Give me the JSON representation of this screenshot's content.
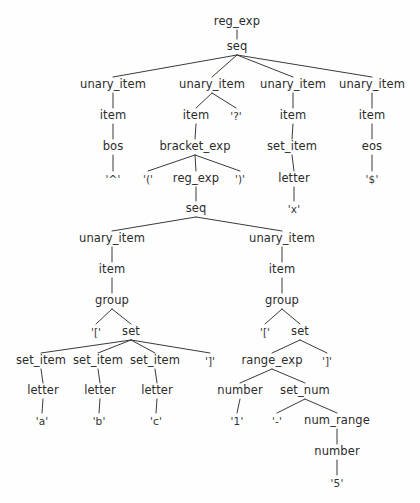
{
  "figure": {
    "kind": "parse-tree",
    "background_color": "#fefefe",
    "text_color": "#2b2b2b",
    "edge_color": "#3a3a3a"
  },
  "nodes": [
    {
      "id": "n0",
      "label": "reg_exp",
      "x": 237,
      "y": 22,
      "kind": "nonterminal"
    },
    {
      "id": "n1",
      "label": "seq",
      "x": 237,
      "y": 47,
      "kind": "nonterminal"
    },
    {
      "id": "n2",
      "label": "unary_item",
      "x": 113,
      "y": 85,
      "kind": "nonterminal"
    },
    {
      "id": "n3",
      "label": "unary_item",
      "x": 212,
      "y": 85,
      "kind": "nonterminal"
    },
    {
      "id": "n4",
      "label": "unary_item",
      "x": 293,
      "y": 85,
      "kind": "nonterminal"
    },
    {
      "id": "n5",
      "label": "unary_item",
      "x": 372,
      "y": 85,
      "kind": "nonterminal"
    },
    {
      "id": "n6",
      "label": "item",
      "x": 113,
      "y": 116,
      "kind": "nonterminal"
    },
    {
      "id": "n7",
      "label": "item",
      "x": 196,
      "y": 116,
      "kind": "nonterminal"
    },
    {
      "id": "n8",
      "label": "'?'",
      "x": 236,
      "y": 116,
      "kind": "terminal"
    },
    {
      "id": "n9",
      "label": "item",
      "x": 293,
      "y": 116,
      "kind": "nonterminal"
    },
    {
      "id": "n10",
      "label": "item",
      "x": 372,
      "y": 116,
      "kind": "nonterminal"
    },
    {
      "id": "n11",
      "label": "bos",
      "x": 113,
      "y": 147,
      "kind": "nonterminal"
    },
    {
      "id": "n12",
      "label": "bracket_exp",
      "x": 195,
      "y": 147,
      "kind": "nonterminal"
    },
    {
      "id": "n13",
      "label": "set_item",
      "x": 292,
      "y": 147,
      "kind": "nonterminal"
    },
    {
      "id": "n14",
      "label": "eos",
      "x": 372,
      "y": 147,
      "kind": "nonterminal"
    },
    {
      "id": "n15",
      "label": "'^'",
      "x": 113,
      "y": 179,
      "kind": "terminal"
    },
    {
      "id": "n16",
      "label": "'('",
      "x": 148,
      "y": 179,
      "kind": "terminal"
    },
    {
      "id": "n17",
      "label": "reg_exp",
      "x": 196,
      "y": 179,
      "kind": "nonterminal"
    },
    {
      "id": "n18",
      "label": "')'",
      "x": 240,
      "y": 179,
      "kind": "terminal"
    },
    {
      "id": "n19",
      "label": "letter",
      "x": 294,
      "y": 179,
      "kind": "nonterminal"
    },
    {
      "id": "n20",
      "label": "'$'",
      "x": 372,
      "y": 179,
      "kind": "terminal"
    },
    {
      "id": "n21",
      "label": "seq",
      "x": 196,
      "y": 209,
      "kind": "nonterminal"
    },
    {
      "id": "n22",
      "label": "'x'",
      "x": 294,
      "y": 209,
      "kind": "terminal"
    },
    {
      "id": "n23",
      "label": "unary_item",
      "x": 112,
      "y": 239,
      "kind": "nonterminal"
    },
    {
      "id": "n24",
      "label": "unary_item",
      "x": 282,
      "y": 239,
      "kind": "nonterminal"
    },
    {
      "id": "n25",
      "label": "item",
      "x": 112,
      "y": 270,
      "kind": "nonterminal"
    },
    {
      "id": "n26",
      "label": "item",
      "x": 282,
      "y": 270,
      "kind": "nonterminal"
    },
    {
      "id": "n27",
      "label": "group",
      "x": 112,
      "y": 301,
      "kind": "nonterminal"
    },
    {
      "id": "n28",
      "label": "group",
      "x": 282,
      "y": 301,
      "kind": "nonterminal"
    },
    {
      "id": "n29",
      "label": "'['",
      "x": 96,
      "y": 332,
      "kind": "terminal"
    },
    {
      "id": "n30",
      "label": "set",
      "x": 131,
      "y": 332,
      "kind": "nonterminal"
    },
    {
      "id": "n31",
      "label": "'['",
      "x": 265,
      "y": 332,
      "kind": "terminal"
    },
    {
      "id": "n32",
      "label": "set",
      "x": 300,
      "y": 332,
      "kind": "nonterminal"
    },
    {
      "id": "n33",
      "label": "set_item",
      "x": 41,
      "y": 361,
      "kind": "nonterminal"
    },
    {
      "id": "n34",
      "label": "set_item",
      "x": 98,
      "y": 361,
      "kind": "nonterminal"
    },
    {
      "id": "n35",
      "label": "set_item",
      "x": 155,
      "y": 361,
      "kind": "nonterminal"
    },
    {
      "id": "n36",
      "label": "']'",
      "x": 210,
      "y": 361,
      "kind": "terminal"
    },
    {
      "id": "n37",
      "label": "range_exp",
      "x": 272,
      "y": 361,
      "kind": "nonterminal"
    },
    {
      "id": "n38",
      "label": "']'",
      "x": 327,
      "y": 361,
      "kind": "terminal"
    },
    {
      "id": "n39",
      "label": "letter",
      "x": 43,
      "y": 391,
      "kind": "nonterminal"
    },
    {
      "id": "n40",
      "label": "letter",
      "x": 100,
      "y": 391,
      "kind": "nonterminal"
    },
    {
      "id": "n41",
      "label": "letter",
      "x": 157,
      "y": 391,
      "kind": "nonterminal"
    },
    {
      "id": "n42",
      "label": "number",
      "x": 240,
      "y": 391,
      "kind": "nonterminal"
    },
    {
      "id": "n43",
      "label": "set_num",
      "x": 305,
      "y": 391,
      "kind": "nonterminal"
    },
    {
      "id": "n44",
      "label": "'a'",
      "x": 42,
      "y": 421,
      "kind": "terminal"
    },
    {
      "id": "n45",
      "label": "'b'",
      "x": 99,
      "y": 421,
      "kind": "terminal"
    },
    {
      "id": "n46",
      "label": "'c'",
      "x": 156,
      "y": 421,
      "kind": "terminal"
    },
    {
      "id": "n47",
      "label": "'1'",
      "x": 237,
      "y": 421,
      "kind": "terminal"
    },
    {
      "id": "n48",
      "label": "'-'",
      "x": 277,
      "y": 421,
      "kind": "terminal"
    },
    {
      "id": "n49",
      "label": "num_range",
      "x": 337,
      "y": 421,
      "kind": "nonterminal"
    },
    {
      "id": "n50",
      "label": "number",
      "x": 337,
      "y": 452,
      "kind": "nonterminal"
    },
    {
      "id": "n51",
      "label": "'5'",
      "x": 337,
      "y": 483,
      "kind": "terminal"
    }
  ],
  "edges": [
    [
      "n0",
      "n1"
    ],
    [
      "n1",
      "n2"
    ],
    [
      "n1",
      "n3"
    ],
    [
      "n1",
      "n4"
    ],
    [
      "n1",
      "n5"
    ],
    [
      "n2",
      "n6"
    ],
    [
      "n3",
      "n7"
    ],
    [
      "n3",
      "n8"
    ],
    [
      "n4",
      "n9"
    ],
    [
      "n5",
      "n10"
    ],
    [
      "n6",
      "n11"
    ],
    [
      "n7",
      "n12"
    ],
    [
      "n9",
      "n13"
    ],
    [
      "n10",
      "n14"
    ],
    [
      "n11",
      "n15"
    ],
    [
      "n12",
      "n16"
    ],
    [
      "n12",
      "n17"
    ],
    [
      "n12",
      "n18"
    ],
    [
      "n13",
      "n19"
    ],
    [
      "n14",
      "n20"
    ],
    [
      "n17",
      "n21"
    ],
    [
      "n19",
      "n22"
    ],
    [
      "n21",
      "n23"
    ],
    [
      "n21",
      "n24"
    ],
    [
      "n23",
      "n25"
    ],
    [
      "n24",
      "n26"
    ],
    [
      "n25",
      "n27"
    ],
    [
      "n26",
      "n28"
    ],
    [
      "n27",
      "n29"
    ],
    [
      "n27",
      "n30"
    ],
    [
      "n28",
      "n31"
    ],
    [
      "n28",
      "n32"
    ],
    [
      "n30",
      "n33"
    ],
    [
      "n30",
      "n34"
    ],
    [
      "n30",
      "n35"
    ],
    [
      "n30",
      "n36"
    ],
    [
      "n32",
      "n37"
    ],
    [
      "n32",
      "n38"
    ],
    [
      "n33",
      "n39"
    ],
    [
      "n34",
      "n40"
    ],
    [
      "n35",
      "n41"
    ],
    [
      "n37",
      "n42"
    ],
    [
      "n37",
      "n43"
    ],
    [
      "n39",
      "n44"
    ],
    [
      "n40",
      "n45"
    ],
    [
      "n41",
      "n46"
    ],
    [
      "n42",
      "n47"
    ],
    [
      "n43",
      "n48"
    ],
    [
      "n43",
      "n49"
    ],
    [
      "n49",
      "n50"
    ],
    [
      "n50",
      "n51"
    ]
  ],
  "watermark": {
    "text": ""
  }
}
